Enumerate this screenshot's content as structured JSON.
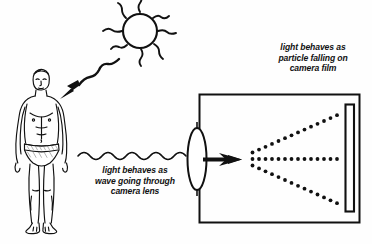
{
  "diagram": {
    "background_color": "#fefefe",
    "ink_color": "#111111"
  },
  "captions": {
    "particle": {
      "text": "light behaves as\nparticle falling on\ncamera film",
      "lines": [
        "light behaves as",
        "particle falling on",
        "camera film"
      ]
    },
    "wave": {
      "text": "light behaves as\nwave going through\ncamera lens",
      "lines": [
        "light behaves as",
        "wave going through",
        "camera lens"
      ]
    }
  },
  "elements": {
    "sun": {
      "label": "sun",
      "rays": 8
    },
    "person": {
      "label": "person standing"
    },
    "sun_arrow": {
      "label": "wavy arrow from sun to person"
    },
    "wave_line": {
      "label": "light wave travelling to lens"
    },
    "lens": {
      "label": "camera lens"
    },
    "camera_body": {
      "label": "camera body"
    },
    "particle_rays": {
      "label": "dotted particle paths",
      "count": 3
    },
    "film": {
      "label": "camera film"
    },
    "arrow": {
      "label": "light direction arrow"
    }
  }
}
